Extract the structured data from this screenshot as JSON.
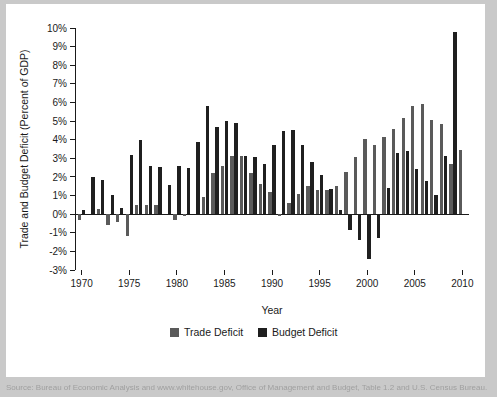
{
  "figure": {
    "background_color": "#c9c9c9",
    "plate_color": "#ffffff"
  },
  "source_note": "Source: Bureau of Economic Analysis and www.whitehouse.gov, Office of Management and Budget, Table 1.2 and U.S. Census Bureau.",
  "legend": {
    "position": "bottom-center",
    "entries": [
      {
        "label": "Trade Deficit",
        "color": "#5a5a5a"
      },
      {
        "label": "Budget Deficit",
        "color": "#1f1f1f"
      }
    ]
  },
  "chart_data": {
    "type": "bar",
    "title": "",
    "xlabel": "Year",
    "ylabel": "Trade and Budget Deficit (Percent of GDP)",
    "grid": false,
    "legend_position": "bottom-center",
    "ylim": [
      -3,
      10
    ],
    "ytick_values": [
      -3,
      -2,
      -1,
      0,
      1,
      2,
      3,
      4,
      5,
      6,
      7,
      8,
      9,
      10
    ],
    "ytick_labels": [
      "-3%",
      "-2%",
      "-1%",
      "0%",
      "1%",
      "2%",
      "3%",
      "4%",
      "5%",
      "6%",
      "7%",
      "8%",
      "9%",
      "10%"
    ],
    "xlim": [
      1969.3,
      2010.7
    ],
    "xtick_values": [
      1970,
      1975,
      1980,
      1985,
      1990,
      1995,
      2000,
      2005,
      2010
    ],
    "xtick_labels": [
      "1970",
      "1975",
      "1980",
      "1985",
      "1990",
      "1995",
      "2000",
      "2005",
      "2010"
    ],
    "categories": [
      1970,
      1971,
      1972,
      1973,
      1974,
      1975,
      1976,
      1977,
      1978,
      1979,
      1980,
      1981,
      1982,
      1983,
      1984,
      1985,
      1986,
      1987,
      1988,
      1989,
      1990,
      1991,
      1992,
      1993,
      1994,
      1995,
      1996,
      1997,
      1998,
      1999,
      2000,
      2001,
      2002,
      2003,
      2004,
      2005,
      2006,
      2007,
      2008,
      2009,
      2010
    ],
    "series": [
      {
        "name": "Trade Deficit",
        "color": "#5a5a5a",
        "values": [
          -0.3,
          0.0,
          0.3,
          -0.6,
          -0.4,
          -1.2,
          0.5,
          0.5,
          0.5,
          0.0,
          -0.3,
          -0.1,
          0.0,
          0.9,
          2.2,
          2.6,
          3.1,
          3.1,
          2.2,
          1.6,
          1.2,
          -0.1,
          0.6,
          1.1,
          1.5,
          1.3,
          1.3,
          1.5,
          2.25,
          3.05,
          4.05,
          3.7,
          4.15,
          4.55,
          5.18,
          5.8,
          5.9,
          5.07,
          4.85,
          2.7,
          3.45
        ]
      },
      {
        "name": "Budget Deficit",
        "color": "#1f1f1f",
        "values": [
          0.25,
          2.0,
          1.85,
          1.05,
          0.35,
          3.2,
          3.98,
          2.6,
          2.55,
          1.55,
          2.6,
          2.48,
          3.88,
          5.83,
          4.67,
          5.0,
          4.9,
          3.15,
          3.05,
          2.7,
          3.72,
          4.45,
          4.52,
          3.72,
          2.78,
          2.1,
          1.35,
          0.2,
          -0.85,
          -1.37,
          -2.4,
          -1.28,
          1.4,
          3.3,
          3.38,
          2.42,
          1.78,
          1.05,
          3.1,
          9.8,
          0.0
        ]
      }
    ]
  }
}
